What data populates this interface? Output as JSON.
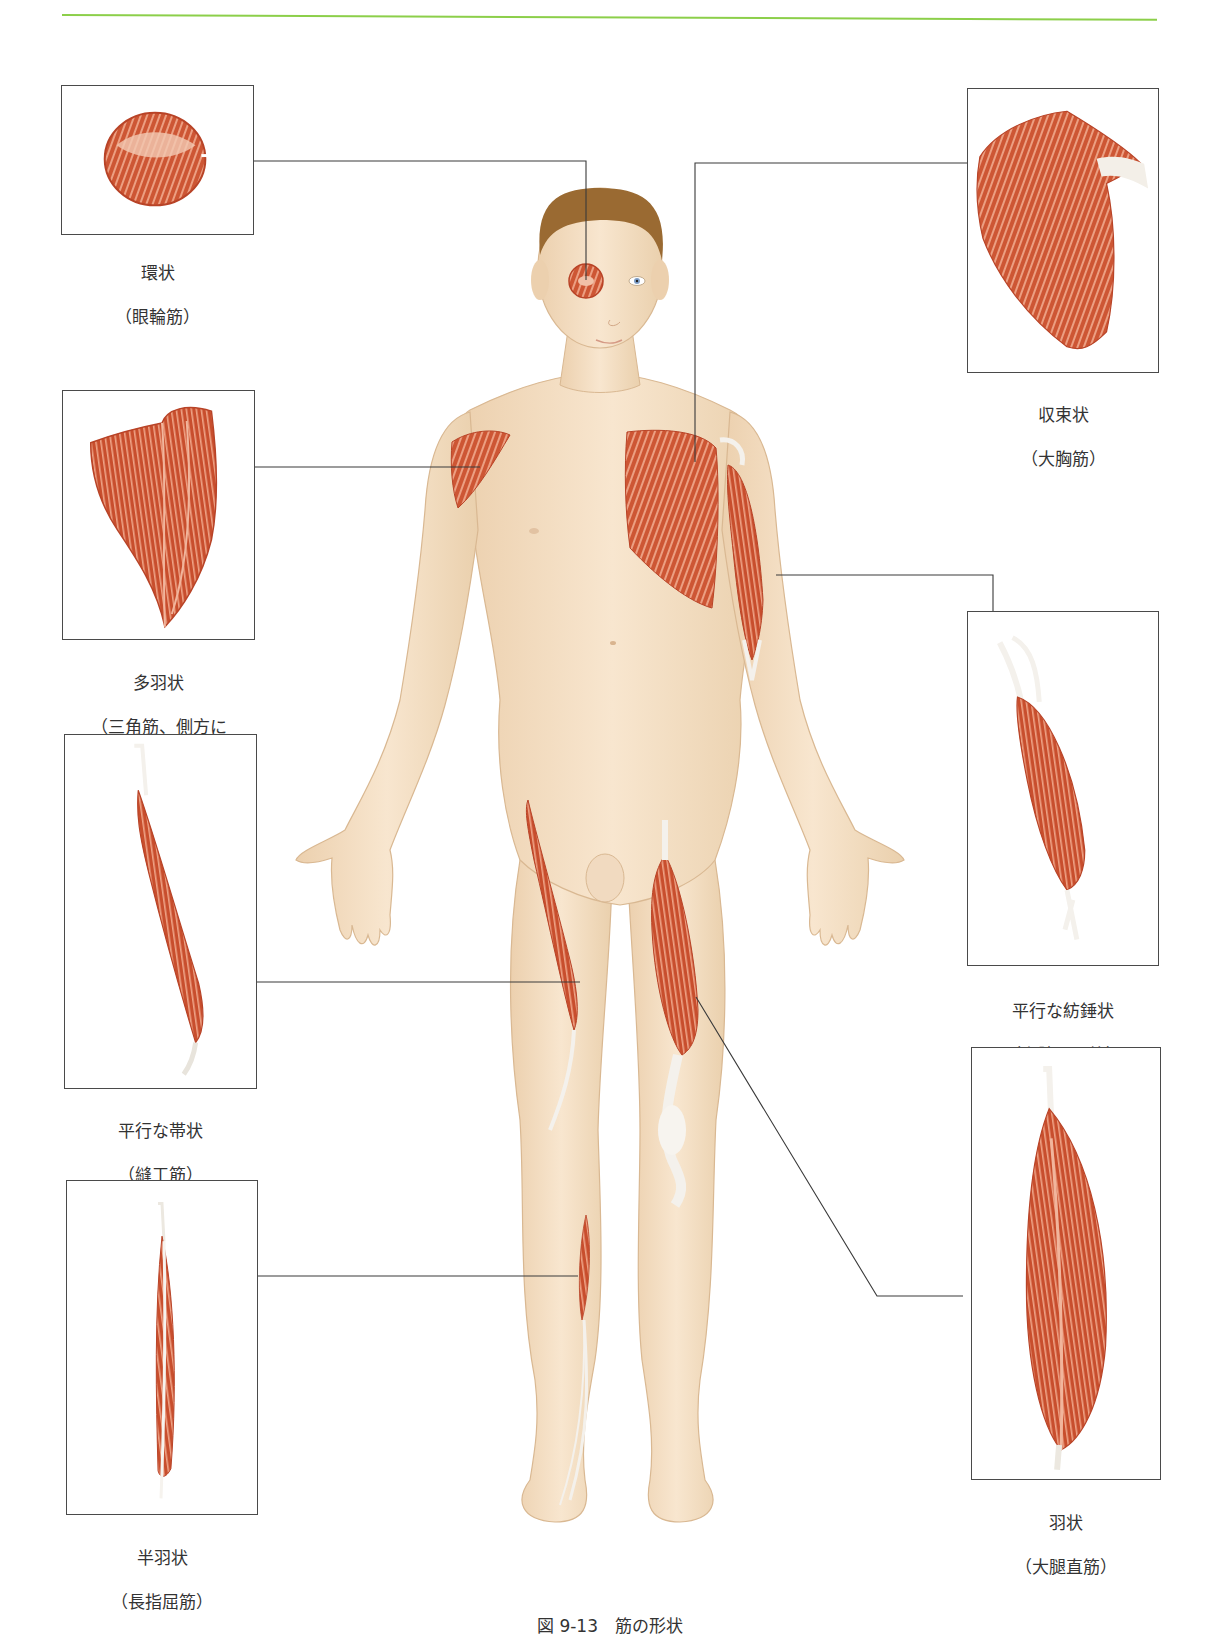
{
  "page": {
    "accent_rule_color": "#8ccf4a",
    "page_number": "",
    "caption": "図 9-13　筋の形状"
  },
  "figure": {
    "skin_color": "#f3dcc0",
    "muscle_color": "#c9502f",
    "tendon_color": "#f4f1ec",
    "hair_color": "#9a6a32"
  },
  "insets": [
    {
      "id": "circular",
      "title": "環状",
      "muscle": "（眼輪筋）",
      "side": "left",
      "target": "right eye"
    },
    {
      "id": "multipennate",
      "title": "多羽状",
      "muscle": "（三角筋、側方に\nみられる）",
      "side": "left",
      "target": "shoulder"
    },
    {
      "id": "parallel-strap",
      "title": "平行な帯状",
      "muscle": "（縫工筋）",
      "side": "left",
      "target": "thigh (sartorius)"
    },
    {
      "id": "unipennate",
      "title": "半羽状",
      "muscle": "（長指屈筋）",
      "side": "left",
      "target": "lower leg"
    },
    {
      "id": "convergent",
      "title": "収束状",
      "muscle": "（大胸筋）",
      "side": "right",
      "target": "chest"
    },
    {
      "id": "fusiform",
      "title": "平行な紡錘状",
      "muscle": "（上腕二頭筋）",
      "side": "right",
      "target": "upper arm"
    },
    {
      "id": "bipennate",
      "title": "羽状",
      "muscle": "（大腿直筋）",
      "side": "right",
      "target": "thigh (rectus femoris)"
    }
  ]
}
